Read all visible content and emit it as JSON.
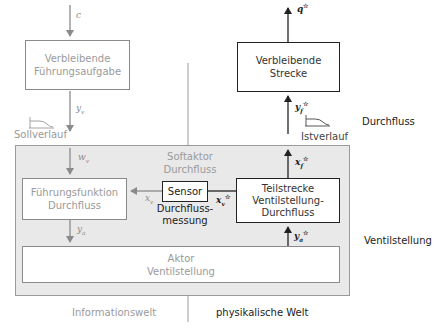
{
  "diagram": {
    "colors": {
      "information_world": "#9a9a9a",
      "physical_world": "#222222",
      "softactor_region": "#e9e9e9"
    },
    "left": {
      "input_var": "c",
      "top_box": {
        "line1": "Verbleibende",
        "line2": "Führungsaufgabe"
      },
      "output_var": "y",
      "output_var_sub": "v",
      "setpoint_label": "Sollverlauf"
    },
    "right": {
      "output_var": "q",
      "output_var_sup": "☆",
      "top_box": {
        "line1": "Verbleibende",
        "line2": "Strecke"
      },
      "input_var": "y",
      "input_var_sub": "f",
      "input_var_sup": "☆",
      "actual_label": "Istverlauf",
      "side_label_flow": "Durchfluss",
      "side_label_valve": "Ventilstellung"
    },
    "softactor": {
      "title_line1": "Softaktor",
      "title_line2": "Durchfluss",
      "w_var": "w",
      "w_sub": "v",
      "guidance_box": {
        "line1": "Führungsfunktion",
        "line2": "Durchfluss"
      },
      "xv_var": "x",
      "xv_sub": "v",
      "sensor_label": "Sensor",
      "sensor_caption_line1": "Durchfluss-",
      "sensor_caption_line2": "messung",
      "xv_star_var": "x",
      "xv_star_sub": "v",
      "xv_star_sup": "☆",
      "xf_var": "x",
      "xf_sub": "f",
      "xf_sup": "☆",
      "plant_box": {
        "line1": "Teilstrecke",
        "line2": "Ventilstellung-",
        "line3": "Durchfluss"
      },
      "ya_var": "y",
      "ya_sub": "a",
      "ya_star_var": "y",
      "ya_star_sub": "a",
      "ya_star_sup": "☆",
      "actor_box": {
        "line1": "Aktor",
        "line2": "Ventilstellung"
      }
    },
    "footer": {
      "left_label": "Informationswelt",
      "right_label": "physikalische Welt"
    }
  }
}
